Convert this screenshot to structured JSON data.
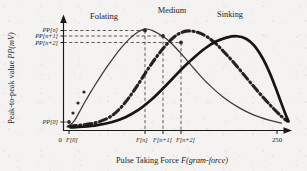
{
  "chart_data": {
    "type": "line",
    "title": "",
    "xlabel": "Pulse Taking Force F(gram-force)",
    "xlabel_plain": "Pulse Taking Force ",
    "xlabel_italic": "F(gram-force)",
    "ylabel": "Peak-to-peak value PP(mV)",
    "ylabel_plain": "Peak-to-peak value ",
    "ylabel_italic": "PP(mV)",
    "xlim": [
      0,
      250
    ],
    "ylim": [
      0,
      1
    ],
    "grid": false,
    "legend_position": "above-curves",
    "x_ticks": [
      {
        "label": "0",
        "value": 0,
        "italic": false
      },
      {
        "label": "F[0]",
        "value": 6,
        "italic": true
      },
      {
        "label": "F[n]",
        "value": 92,
        "italic": true
      },
      {
        "label": "F[n+1]",
        "value": 112,
        "italic": true
      },
      {
        "label": "F[n+2]",
        "value": 132,
        "italic": true
      }
    ],
    "x_tick_end": {
      "label": "250",
      "value": 250
    },
    "y_ticks": [
      {
        "label": "PP[n]",
        "value": 0.955
      },
      {
        "label": "PP[n+1]",
        "value": 0.905
      },
      {
        "label": "PP[n+2]",
        "value": 0.845
      },
      {
        "label": "PP[0]",
        "value": 0.09
      }
    ],
    "series": [
      {
        "name": "Folating",
        "style": "thin-solid",
        "color": "#3a3937",
        "peak_x": 92,
        "peak_y": 0.955,
        "points": [
          [
            4,
            0.035
          ],
          [
            8,
            0.055
          ],
          [
            13,
            0.1
          ],
          [
            18,
            0.175
          ],
          [
            24,
            0.265
          ],
          [
            31,
            0.365
          ],
          [
            39,
            0.47
          ],
          [
            48,
            0.585
          ],
          [
            57,
            0.69
          ],
          [
            66,
            0.785
          ],
          [
            75,
            0.865
          ],
          [
            84,
            0.925
          ],
          [
            92,
            0.955
          ],
          [
            100,
            0.94
          ],
          [
            108,
            0.905
          ],
          [
            116,
            0.862
          ],
          [
            124,
            0.8
          ],
          [
            135,
            0.7
          ],
          [
            148,
            0.575
          ],
          [
            163,
            0.44
          ],
          [
            180,
            0.315
          ],
          [
            198,
            0.215
          ],
          [
            215,
            0.145
          ],
          [
            232,
            0.098
          ],
          [
            246,
            0.07
          ]
        ]
      },
      {
        "name": "Medium",
        "style": "dash-dot-thick",
        "color": "#23221f",
        "peak_x": 142,
        "peak_y": 0.935,
        "points": [
          [
            6,
            0.04
          ],
          [
            16,
            0.048
          ],
          [
            28,
            0.06
          ],
          [
            40,
            0.082
          ],
          [
            52,
            0.125
          ],
          [
            63,
            0.2
          ],
          [
            74,
            0.31
          ],
          [
            84,
            0.43
          ],
          [
            94,
            0.56
          ],
          [
            104,
            0.68
          ],
          [
            114,
            0.785
          ],
          [
            124,
            0.872
          ],
          [
            133,
            0.92
          ],
          [
            142,
            0.935
          ],
          [
            152,
            0.92
          ],
          [
            162,
            0.88
          ],
          [
            172,
            0.815
          ],
          [
            182,
            0.73
          ],
          [
            193,
            0.63
          ],
          [
            204,
            0.52
          ],
          [
            215,
            0.41
          ],
          [
            226,
            0.305
          ],
          [
            236,
            0.215
          ],
          [
            245,
            0.14
          ],
          [
            252,
            0.09
          ]
        ]
      },
      {
        "name": "Sinking",
        "style": "thick-solid",
        "color": "#16150f",
        "peak_x": 196,
        "peak_y": 0.885,
        "points": [
          [
            8,
            0.028
          ],
          [
            22,
            0.035
          ],
          [
            38,
            0.05
          ],
          [
            54,
            0.078
          ],
          [
            70,
            0.125
          ],
          [
            85,
            0.195
          ],
          [
            99,
            0.288
          ],
          [
            112,
            0.392
          ],
          [
            124,
            0.495
          ],
          [
            136,
            0.598
          ],
          [
            148,
            0.69
          ],
          [
            160,
            0.772
          ],
          [
            172,
            0.835
          ],
          [
            184,
            0.872
          ],
          [
            196,
            0.885
          ],
          [
            206,
            0.862
          ],
          [
            215,
            0.8
          ],
          [
            224,
            0.69
          ],
          [
            232,
            0.555
          ],
          [
            239,
            0.41
          ],
          [
            245,
            0.275
          ],
          [
            250,
            0.165
          ],
          [
            254,
            0.085
          ]
        ]
      }
    ],
    "curve_labels": [
      {
        "text": "Folating",
        "x": 104,
        "y": 19
      },
      {
        "text": "Medium",
        "x": 172,
        "y": 13
      },
      {
        "text": "Sinking",
        "x": 228,
        "y": 17
      }
    ],
    "markers": [
      {
        "series": "Folating",
        "x": 92,
        "y": 0.955,
        "note": "PP[n] at F[n]"
      },
      {
        "series": "Folating",
        "x": 112,
        "y": 0.905,
        "note": "PP[n+1] at F[n+1]"
      },
      {
        "series": "Folating",
        "x": 132,
        "y": 0.845,
        "note": "PP[n+2] at F[n+2]"
      },
      {
        "series": "Folating",
        "x": 6,
        "y": 0.09,
        "note": "PP[0] at F[0]"
      }
    ],
    "guide_lines": {
      "vertical_from": [
        "F[n]",
        "F[n+1]",
        "F[n+2]"
      ],
      "horizontal_to": [
        "PP[n]",
        "PP[n+1]",
        "PP[n+2]"
      ],
      "style": "dashed"
    }
  }
}
